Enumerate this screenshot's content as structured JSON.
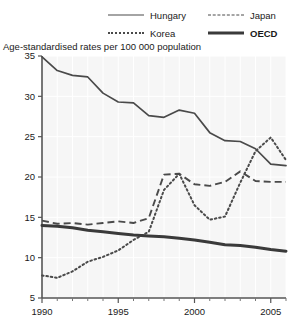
{
  "legend": {
    "items": [
      {
        "label": "Hungary",
        "style": "solid",
        "bold": false
      },
      {
        "label": "Korea",
        "style": "dotted",
        "bold": false
      },
      {
        "label": "Japan",
        "style": "dashed",
        "bold": false
      },
      {
        "label": "OECD",
        "style": "thick",
        "bold": true
      }
    ]
  },
  "subtitle": "Age-standardised rates per 100 000 population",
  "chart_data": {
    "type": "line",
    "title": "",
    "subtitle": "Age-standardised rates per 100 000 population",
    "xlabel": "",
    "ylabel": "",
    "xlim": [
      1990,
      2006
    ],
    "ylim": [
      5,
      35
    ],
    "yticks": [
      5,
      10,
      15,
      20,
      25,
      30,
      35
    ],
    "ytick_labels": [
      "5",
      "10",
      "15",
      "20",
      "25",
      "30",
      "35"
    ],
    "xticks": [
      1990,
      1995,
      2000,
      2005
    ],
    "xtick_labels": [
      "1990",
      "1995",
      "2000",
      "2005"
    ],
    "xminorticks": [
      1991,
      1992,
      1993,
      1994,
      1996,
      1997,
      1998,
      1999,
      2001,
      2002,
      2003,
      2004,
      2006
    ],
    "grid": true,
    "legend_position": "top",
    "x": [
      1990,
      1991,
      1992,
      1993,
      1994,
      1995,
      1996,
      1997,
      1998,
      1999,
      2000,
      2001,
      2002,
      2003,
      2004,
      2005,
      2006
    ],
    "series": [
      {
        "name": "Hungary",
        "style": "solid",
        "color": "#4a4a4a",
        "values": [
          34.9,
          33.2,
          32.6,
          32.4,
          30.4,
          29.3,
          29.2,
          27.6,
          27.4,
          28.3,
          27.9,
          25.5,
          24.5,
          24.4,
          23.5,
          21.6,
          21.4
        ]
      },
      {
        "name": "Korea",
        "style": "dotted",
        "color": "#4a4a4a",
        "values": [
          7.8,
          7.5,
          8.3,
          9.5,
          10.1,
          10.9,
          12.2,
          13.2,
          18.4,
          20.4,
          16.5,
          14.7,
          15.1,
          19.3,
          23.2,
          24.9,
          22.1
        ]
      },
      {
        "name": "Japan",
        "style": "dashed",
        "color": "#4a4a4a",
        "values": [
          14.6,
          14.2,
          14.3,
          14.1,
          14.3,
          14.5,
          14.3,
          14.9,
          20.3,
          20.4,
          19.1,
          18.9,
          19.4,
          20.7,
          19.5,
          19.4,
          19.4
        ]
      },
      {
        "name": "OECD",
        "style": "thick",
        "color": "#3a3a3a",
        "values": [
          14.0,
          13.9,
          13.7,
          13.4,
          13.2,
          13.0,
          12.8,
          12.7,
          12.6,
          12.4,
          12.2,
          11.9,
          11.6,
          11.5,
          11.3,
          11.0,
          10.8
        ]
      }
    ]
  }
}
